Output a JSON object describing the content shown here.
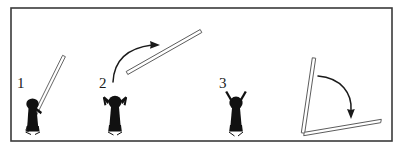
{
  "figure": {
    "frame": {
      "stroke_color": "#3a3a3a",
      "fill_color": "#ffffff",
      "x": 11,
      "y": 8,
      "width": 381,
      "height": 133,
      "stroke_width": 1.6
    },
    "colors": {
      "ink": "#1a1a1a",
      "outline": "#4a4a4a",
      "pole_fill": "#ffffff",
      "figure_fill": "#111111",
      "background": "#ffffff"
    },
    "stages": [
      {
        "id": "stage-1",
        "label": "1",
        "label_x": 17,
        "label_y": 88,
        "description": "person crouched beside pole resting at a steep angle on the ground",
        "pole": {
          "x1": 27,
          "y1": 131,
          "x2": 64,
          "y2": 56,
          "thickness": 3.2
        },
        "person": {
          "pose": "crouched",
          "cx": 33,
          "cy": 113
        }
      },
      {
        "id": "stage-2",
        "label": "2",
        "label_x": 99,
        "label_y": 88,
        "description": "person with bent arms raised; pole airborne travelling up and to the right",
        "pole": {
          "x1": 127,
          "y1": 73,
          "x2": 201,
          "y2": 31,
          "thickness": 3.2
        },
        "person": {
          "pose": "arms-bent-up",
          "cx": 115,
          "cy": 113
        },
        "arrow": {
          "id": "motion-arrow-up",
          "description": "curved arrow showing upward-right pole motion",
          "path": "M 113 82 C 114 60 128 48 152 45",
          "head_x": 160,
          "head_y": 45,
          "head_angle": -6
        }
      },
      {
        "id": "stage-3",
        "label": "3",
        "label_x": 219,
        "label_y": 88,
        "description": "person standing with both arms raised in a V",
        "person": {
          "pose": "arms-up-v",
          "cx": 236,
          "cy": 113
        }
      },
      {
        "id": "stage-4",
        "label": "",
        "description": "pole tipping from near-vertical to lying on the ground",
        "pole_upright": {
          "x1": 303,
          "y1": 133,
          "x2": 314,
          "y2": 58,
          "thickness": 3.2
        },
        "pole_fallen": {
          "x1": 304,
          "y1": 134,
          "x2": 381,
          "y2": 121,
          "thickness": 3.2
        },
        "arrow": {
          "id": "motion-arrow-down",
          "description": "curved arrow showing pole falling clockwise to the ground",
          "path": "M 318 76 C 342 78 352 94 351 110",
          "head_x": 351,
          "head_y": 119,
          "head_angle": 86
        }
      }
    ]
  }
}
